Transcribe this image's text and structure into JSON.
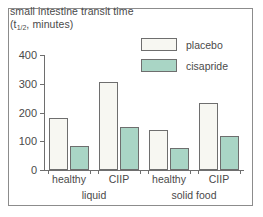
{
  "chart_data": {
    "type": "bar",
    "title": "small intestine transit time (t1/2, minutes)",
    "title_line1": "small intestine transit time",
    "title_line2_prefix": "(t",
    "title_line2_frac": "1/2",
    "title_line2_suffix": ", minutes)",
    "xlabel": "",
    "ylabel": "",
    "ylim": [
      0,
      400
    ],
    "yticks": [
      0,
      100,
      200,
      300,
      400
    ],
    "ytick_labels": [
      "0",
      "100",
      "200",
      "300",
      "400"
    ],
    "grid": false,
    "legend_position": "top-right",
    "categories": [
      "healthy",
      "CIIP",
      "healthy",
      "CIIP"
    ],
    "groups": [
      {
        "label": "liquid",
        "categories": [
          "healthy",
          "CIIP"
        ]
      },
      {
        "label": "solid food",
        "categories": [
          "healthy",
          "CIIP"
        ]
      }
    ],
    "series": [
      {
        "name": "placebo",
        "color": "#f7f7f2",
        "edge_color": "#6e6e6e",
        "values": [
          180,
          307,
          138,
          232
        ]
      },
      {
        "name": "cisapride",
        "color": "#a9d5c5",
        "edge_color": "#6e6e6e",
        "values": [
          82,
          148,
          75,
          118
        ]
      }
    ]
  },
  "legend": {
    "items": [
      {
        "label": "placebo",
        "color": "#f7f7f2"
      },
      {
        "label": "cisapride",
        "color": "#a9d5c5"
      }
    ]
  },
  "axis": {
    "y_ticks": [
      "0",
      "100",
      "200",
      "300",
      "400"
    ],
    "category_labels": [
      "healthy",
      "CIIP",
      "healthy",
      "CIIP"
    ],
    "group_labels": [
      "liquid",
      "solid food"
    ]
  },
  "colors": {
    "placebo": "#f7f7f2",
    "cisapride": "#a9d5c5",
    "axis": "#6e6e6e",
    "text": "#4a4a4a",
    "frame": "#8c8c8c"
  }
}
